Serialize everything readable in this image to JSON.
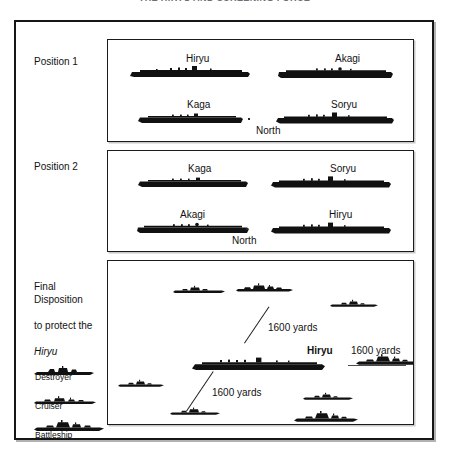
{
  "document": {
    "title": "THE HIRYU AND SCREENING FORCE"
  },
  "diagram": {
    "rows": [
      {
        "label": "Position 1",
        "compass": "North",
        "ships": [
          {
            "name": "Hiryu",
            "type": "carrier"
          },
          {
            "name": "Akagi",
            "type": "carrier"
          },
          {
            "name": "Kaga",
            "type": "carrier"
          },
          {
            "name": "Soryu",
            "type": "carrier"
          }
        ]
      },
      {
        "label": "Position 2",
        "compass": "North",
        "ships": [
          {
            "name": "Kaga",
            "type": "carrier"
          },
          {
            "name": "Soryu",
            "type": "carrier"
          },
          {
            "name": "Akagi",
            "type": "carrier"
          },
          {
            "name": "Hiryu",
            "type": "carrier"
          }
        ]
      },
      {
        "label_line1": "Final Disposition",
        "label_line2": "to protect the",
        "label_line3": "Hiryu",
        "center_ship": "Hiryu",
        "annotations": [
          {
            "text": "1600 yards"
          },
          {
            "text": "1600 yards"
          },
          {
            "text": "1600 yards"
          }
        ],
        "escorts": [
          {
            "type": "cruiser"
          },
          {
            "type": "cruiser"
          },
          {
            "type": "destroyer"
          },
          {
            "type": "battleship"
          },
          {
            "type": "destroyer"
          },
          {
            "type": "destroyer"
          },
          {
            "type": "destroyer"
          },
          {
            "type": "battleship"
          }
        ]
      }
    ]
  },
  "legend": {
    "items": [
      {
        "label": "Destroyer",
        "icon": "destroyer-silhouette"
      },
      {
        "label": "Cruiser",
        "icon": "cruiser-silhouette"
      },
      {
        "label": "Battleship",
        "icon": "battleship-silhouette"
      }
    ]
  },
  "colors": {
    "ink": "#161616",
    "paper": "#ffffff",
    "label": "#111111"
  }
}
